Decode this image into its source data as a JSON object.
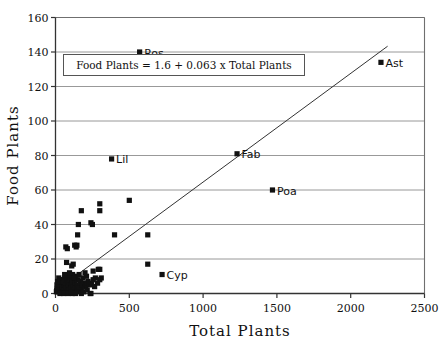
{
  "chart_data": {
    "type": "scatter",
    "title": "",
    "xlabel": "Total Plants",
    "ylabel": "Food Plants",
    "xlim": [
      0,
      2500
    ],
    "ylim": [
      0,
      160
    ],
    "xticks": [
      0,
      500,
      1000,
      1500,
      2000,
      2500
    ],
    "yticks": [
      0,
      20,
      40,
      60,
      80,
      100,
      120,
      140,
      160
    ],
    "grid": "horizontal",
    "legend": "none",
    "annotation": "Food Plants = 1.6 + 0.063 x Total Plants",
    "fit_line": {
      "intercept": 1.6,
      "slope": 0.063,
      "x_start": 0,
      "x_end": 2250
    },
    "marker_color": "#111111",
    "labeled_points": [
      {
        "label": "Ros",
        "x": 570,
        "y": 140
      },
      {
        "label": "Ast",
        "x": 2205,
        "y": 134
      },
      {
        "label": "Fab",
        "x": 1230,
        "y": 81
      },
      {
        "label": "Lil",
        "x": 380,
        "y": 78
      },
      {
        "label": "Poa",
        "x": 1470,
        "y": 60
      },
      {
        "label": "Cyp",
        "x": 722,
        "y": 11
      }
    ],
    "points": [
      {
        "x": 500,
        "y": 54
      },
      {
        "x": 300,
        "y": 52
      },
      {
        "x": 175,
        "y": 48
      },
      {
        "x": 300,
        "y": 48
      },
      {
        "x": 155,
        "y": 40
      },
      {
        "x": 240,
        "y": 41
      },
      {
        "x": 250,
        "y": 40
      },
      {
        "x": 150,
        "y": 34
      },
      {
        "x": 400,
        "y": 34
      },
      {
        "x": 625,
        "y": 34
      },
      {
        "x": 70,
        "y": 27
      },
      {
        "x": 80,
        "y": 26
      },
      {
        "x": 130,
        "y": 28
      },
      {
        "x": 140,
        "y": 27
      },
      {
        "x": 145,
        "y": 28
      },
      {
        "x": 75,
        "y": 18
      },
      {
        "x": 110,
        "y": 16
      },
      {
        "x": 120,
        "y": 17
      },
      {
        "x": 625,
        "y": 17
      },
      {
        "x": 300,
        "y": 14
      },
      {
        "x": 290,
        "y": 14
      },
      {
        "x": 255,
        "y": 13
      },
      {
        "x": 200,
        "y": 12
      },
      {
        "x": 310,
        "y": 9
      },
      {
        "x": 300,
        "y": 8
      },
      {
        "x": 270,
        "y": 9
      },
      {
        "x": 255,
        "y": 8
      },
      {
        "x": 245,
        "y": 6
      },
      {
        "x": 230,
        "y": 5
      },
      {
        "x": 220,
        "y": 7
      },
      {
        "x": 210,
        "y": 10
      },
      {
        "x": 205,
        "y": 4
      },
      {
        "x": 195,
        "y": 6
      },
      {
        "x": 185,
        "y": 9
      },
      {
        "x": 180,
        "y": 5
      },
      {
        "x": 175,
        "y": 3
      },
      {
        "x": 170,
        "y": 7
      },
      {
        "x": 165,
        "y": 4
      },
      {
        "x": 160,
        "y": 11
      },
      {
        "x": 158,
        "y": 2
      },
      {
        "x": 150,
        "y": 8
      },
      {
        "x": 145,
        "y": 5
      },
      {
        "x": 142,
        "y": 3
      },
      {
        "x": 138,
        "y": 10
      },
      {
        "x": 132,
        "y": 6
      },
      {
        "x": 128,
        "y": 2
      },
      {
        "x": 124,
        "y": 8
      },
      {
        "x": 120,
        "y": 4
      },
      {
        "x": 116,
        "y": 11
      },
      {
        "x": 112,
        "y": 6
      },
      {
        "x": 108,
        "y": 3
      },
      {
        "x": 104,
        "y": 9
      },
      {
        "x": 100,
        "y": 5
      },
      {
        "x": 96,
        "y": 7
      },
      {
        "x": 92,
        "y": 2
      },
      {
        "x": 88,
        "y": 10
      },
      {
        "x": 84,
        "y": 4
      },
      {
        "x": 80,
        "y": 6
      },
      {
        "x": 76,
        "y": 8
      },
      {
        "x": 72,
        "y": 3
      },
      {
        "x": 68,
        "y": 5
      },
      {
        "x": 64,
        "y": 9
      },
      {
        "x": 60,
        "y": 2
      },
      {
        "x": 56,
        "y": 7
      },
      {
        "x": 52,
        "y": 4
      },
      {
        "x": 48,
        "y": 6
      },
      {
        "x": 44,
        "y": 1
      },
      {
        "x": 40,
        "y": 8
      },
      {
        "x": 36,
        "y": 3
      },
      {
        "x": 32,
        "y": 5
      },
      {
        "x": 28,
        "y": 2
      },
      {
        "x": 24,
        "y": 6
      },
      {
        "x": 20,
        "y": 4
      },
      {
        "x": 16,
        "y": 1
      },
      {
        "x": 12,
        "y": 3
      },
      {
        "x": 10,
        "y": 5
      },
      {
        "x": 8,
        "y": 2
      },
      {
        "x": 6,
        "y": 1
      },
      {
        "x": 30,
        "y": 0
      },
      {
        "x": 55,
        "y": 0
      },
      {
        "x": 85,
        "y": 0
      },
      {
        "x": 115,
        "y": 0
      },
      {
        "x": 145,
        "y": 1
      },
      {
        "x": 175,
        "y": 0
      },
      {
        "x": 235,
        "y": 0
      },
      {
        "x": 95,
        "y": 12
      },
      {
        "x": 105,
        "y": 1
      },
      {
        "x": 135,
        "y": 0
      },
      {
        "x": 190,
        "y": 1
      },
      {
        "x": 215,
        "y": 2
      },
      {
        "x": 265,
        "y": 4
      },
      {
        "x": 285,
        "y": 6
      },
      {
        "x": 125,
        "y": 9
      },
      {
        "x": 62,
        "y": 11
      },
      {
        "x": 46,
        "y": 8
      },
      {
        "x": 34,
        "y": 7
      },
      {
        "x": 22,
        "y": 9
      },
      {
        "x": 14,
        "y": 7
      },
      {
        "x": 240,
        "y": 0
      }
    ]
  }
}
